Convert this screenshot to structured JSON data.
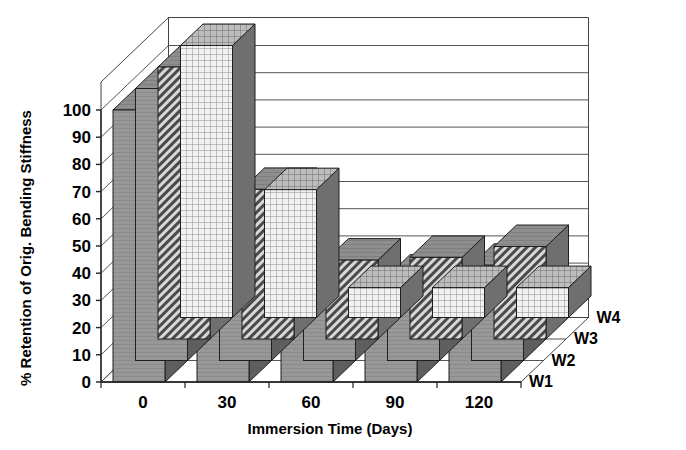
{
  "chart_data": {
    "type": "bar",
    "title": "",
    "subtitle": "",
    "xlabel": "Immersion Time (Days)",
    "ylabel": "% Retention of Orig. Bending Stiffness",
    "categories": [
      "0",
      "30",
      "60",
      "90",
      "120"
    ],
    "x": [
      0,
      30,
      60,
      90,
      120
    ],
    "xtick_labels": [
      "0",
      "30",
      "60",
      "90",
      "120"
    ],
    "ytick_labels": [
      "0",
      "10",
      "20",
      "30",
      "40",
      "50",
      "60",
      "70",
      "80",
      "90",
      "100"
    ],
    "yticks": [
      0,
      10,
      20,
      30,
      40,
      50,
      60,
      70,
      80,
      90,
      100
    ],
    "ylim": [
      0,
      100
    ],
    "grid": true,
    "grid_axis": "y",
    "legend": [
      "W1",
      "W2",
      "W3",
      "W4"
    ],
    "legend_position": "right-depth-axis",
    "projection": "3d-bar",
    "series": [
      {
        "name": "W1",
        "values": [
          100,
          58,
          32,
          33,
          38
        ],
        "fill": "solid-gray",
        "color": "#8c8c8c"
      },
      {
        "name": "W2",
        "values": [
          100,
          56,
          30,
          31,
          35
        ],
        "fill": "solid-gray",
        "color": "#8c8c8c"
      },
      {
        "name": "W3",
        "values": [
          100,
          55,
          29,
          30,
          34
        ],
        "fill": "diagonal-hatch",
        "color": "#9a9a9a"
      },
      {
        "name": "W4",
        "values": [
          100,
          47,
          11,
          11,
          11
        ],
        "fill": "grid-crosshatch",
        "color": "#e8e8e8"
      }
    ]
  },
  "axes": {
    "y_axis_title": "% Retention of Orig. Bending Stiffness",
    "x_axis_title": "Immersion Time (Days)"
  },
  "colors": {
    "bar_front_light": "#ededed",
    "bar_front_mid": "#9c9c9c",
    "bar_top": "#8f8f8f",
    "bar_side": "#6e6e6e",
    "bar_side_dark": "#3a3a3a",
    "grid": "#5a5a5a",
    "axis": "#333333",
    "background": "#ffffff"
  }
}
